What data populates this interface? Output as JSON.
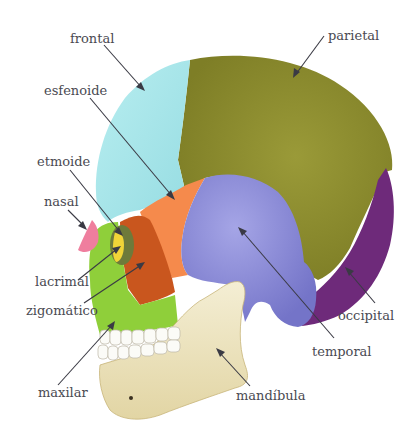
{
  "colors": {
    "frontal": "#a9e6ea",
    "parietal": "#8a8a2c",
    "esfenoide": "#f58a4c",
    "etmoide": "#6e7a3a",
    "nasal": "#ef7e9e",
    "lacrimal": "#f1d438",
    "zigomatico": "#c9561e",
    "maxilar": "#8fcf3a",
    "temporal": "#8585d4",
    "occipital": "#6e2a7a",
    "mandibula": "#efe6c2",
    "label_text": "#4a4a52",
    "pointer": "#3a3a44"
  },
  "labels": {
    "frontal": "frontal",
    "parietal": "parietal",
    "esfenoide": "esfenoide",
    "etmoide": "etmoide",
    "nasal": "nasal",
    "lacrimal": "lacrimal",
    "zigomatico": "zigomático",
    "maxilar": "maxilar",
    "temporal": "temporal",
    "occipital": "occipital",
    "mandibula": "mandíbula"
  }
}
